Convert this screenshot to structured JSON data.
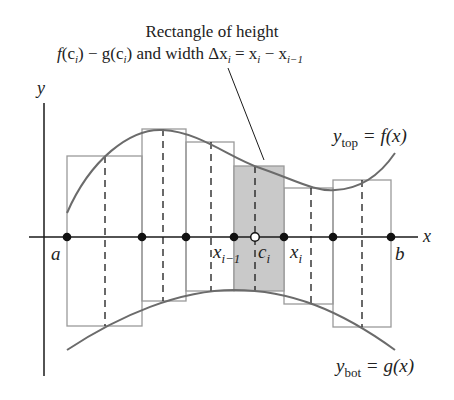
{
  "figure": {
    "callout": {
      "line1": "Rectangle of height",
      "line2_parts": {
        "f": "f",
        "ci_open": "(c",
        "ci_sub": "i",
        "close": ")",
        "minus_g": " − g",
        "ci2_open": "(c",
        "ci2_sub": "i",
        "close2": ")",
        "and_width": " and width ",
        "delta_x": "Δx",
        "delta_sub": "i",
        "eq": " = x",
        "xi_sub": "i",
        "minus": " − x",
        "xim1_sub": "i−1"
      }
    },
    "axes": {
      "x_label": "x",
      "y_label": "y"
    },
    "point_labels": {
      "a": "a",
      "b": "b",
      "x_prev": "x",
      "x_prev_sub": "i−1",
      "c": "c",
      "c_sub": "i",
      "x_i": "x",
      "x_i_sub": "i"
    },
    "curve_labels": {
      "top": {
        "y": "y",
        "sub": "top",
        "rhs": " = f(x)"
      },
      "bot": {
        "y": "y",
        "sub": "bot",
        "rhs": " = g(x)"
      }
    },
    "colors": {
      "curve": "#6b6b6b",
      "rect_stroke": "#9a9a9a",
      "shaded_fill": "#c9c9c9",
      "axis": "#1a1a1a"
    }
  }
}
